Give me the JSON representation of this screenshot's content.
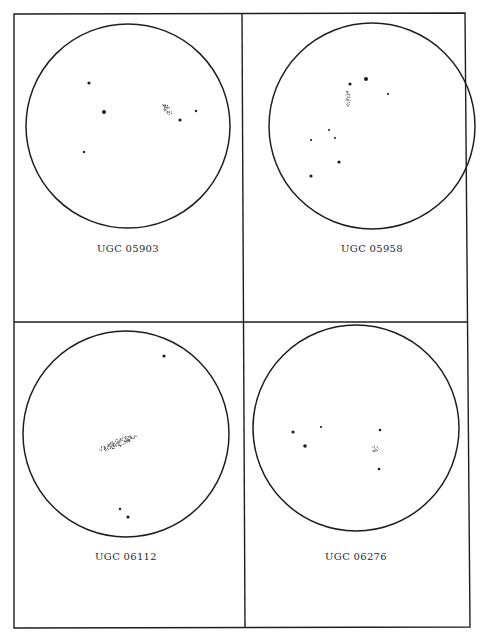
{
  "figure": {
    "background": "#ffffff",
    "ink_color": "#1e1e1e",
    "layout": "2x2 grid of finder charts",
    "panels": [
      {
        "label": "UGC 05903",
        "circle": {
          "cx": 128,
          "cy": 126,
          "r": 102
        },
        "galaxy": {
          "cx": 167,
          "cy": 109,
          "rx": 7,
          "ry": 3,
          "angle": 55
        },
        "stars": [
          {
            "x": 89,
            "y": 83,
            "size": 1.6
          },
          {
            "x": 104,
            "y": 112,
            "size": 2.0
          },
          {
            "x": 180,
            "y": 120,
            "size": 1.6
          },
          {
            "x": 196,
            "y": 111,
            "size": 1.2
          },
          {
            "x": 84,
            "y": 152,
            "size": 1.2
          }
        ]
      },
      {
        "label": "UGC 05958",
        "circle": {
          "cx": 372,
          "cy": 126,
          "r": 103
        },
        "galaxy": {
          "cx": 348,
          "cy": 99,
          "rx": 8,
          "ry": 2.5,
          "angle": 85
        },
        "stars": [
          {
            "x": 350,
            "y": 84,
            "size": 1.6
          },
          {
            "x": 366,
            "y": 79,
            "size": 2.0
          },
          {
            "x": 388,
            "y": 94,
            "size": 1.1
          },
          {
            "x": 329,
            "y": 130,
            "size": 1.0
          },
          {
            "x": 335,
            "y": 138,
            "size": 1.0
          },
          {
            "x": 311,
            "y": 140,
            "size": 1.1
          },
          {
            "x": 339,
            "y": 162,
            "size": 1.6
          },
          {
            "x": 311,
            "y": 176,
            "size": 1.6
          }
        ]
      },
      {
        "label": "UGC 06112",
        "circle": {
          "cx": 126,
          "cy": 434,
          "r": 103
        },
        "galaxy": {
          "cx": 118,
          "cy": 443,
          "rx": 20,
          "ry": 4,
          "angle": -20
        },
        "stars": [
          {
            "x": 164,
            "y": 356,
            "size": 1.6
          },
          {
            "x": 120,
            "y": 509,
            "size": 1.2
          },
          {
            "x": 128,
            "y": 517,
            "size": 1.6
          }
        ]
      },
      {
        "label": "UGC 06276",
        "circle": {
          "cx": 356,
          "cy": 428,
          "r": 103
        },
        "galaxy": {
          "cx": 375,
          "cy": 449,
          "rx": 3.5,
          "ry": 3.5,
          "angle": 0
        },
        "stars": [
          {
            "x": 293,
            "y": 432,
            "size": 1.6
          },
          {
            "x": 321,
            "y": 427,
            "size": 1.1
          },
          {
            "x": 380,
            "y": 430,
            "size": 1.3
          },
          {
            "x": 305,
            "y": 446,
            "size": 1.8
          },
          {
            "x": 379,
            "y": 469,
            "size": 1.3
          }
        ]
      }
    ]
  }
}
